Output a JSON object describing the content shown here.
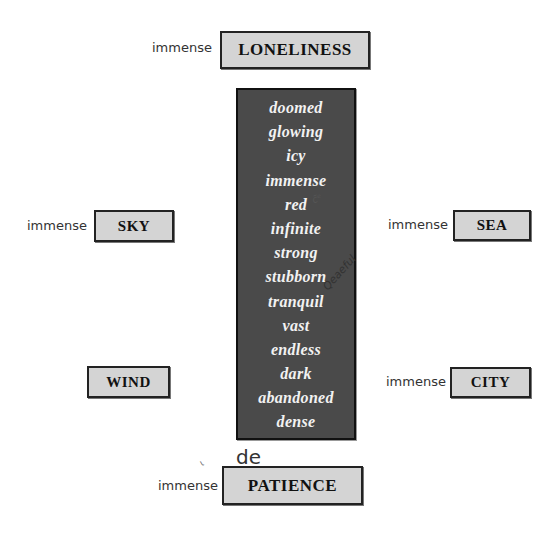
{
  "adjectives_panel": {
    "words": [
      "doomed",
      "glowing",
      "icy",
      "immense",
      "red",
      "infinite",
      "strong",
      "stubborn",
      "tranquil",
      "vast",
      "endless",
      "dark",
      "abandoned",
      "dense"
    ]
  },
  "nouns": {
    "loneliness": {
      "label": "LONELINESS",
      "answer": "immense"
    },
    "sky": {
      "label": "SKY",
      "answer": "immense"
    },
    "sea": {
      "label": "SEA",
      "answer": "immense"
    },
    "wind": {
      "label": "WIND",
      "answer": ""
    },
    "city": {
      "label": "CITY",
      "answer": "immense"
    },
    "patience": {
      "label": "PATIENCE",
      "answer": "immense"
    }
  },
  "handwritten_notes": {
    "near_red": "c̃ᵉ",
    "near_tranquil": "Qeaeful",
    "above_patience": "de",
    "tick_mark": "ι"
  },
  "colors": {
    "panel_background": "#4a4a4a",
    "panel_text": "#f2f2f2",
    "noun_box_background": "#d4d4d4",
    "border": "#222222"
  }
}
